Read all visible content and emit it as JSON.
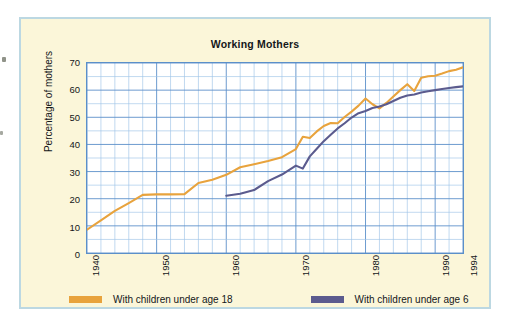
{
  "chart_data": {
    "type": "line",
    "title": "Working Mothers",
    "xlabel": "",
    "ylabel": "Percentage of mothers",
    "xlim": [
      1940,
      1994
    ],
    "ylim": [
      0,
      70
    ],
    "yticks": [
      0,
      10,
      20,
      30,
      40,
      50,
      60,
      70
    ],
    "xticks": [
      1940,
      1950,
      1960,
      1970,
      1980,
      1990,
      1994
    ],
    "grid": true,
    "grid_minor_x_step": 2,
    "grid_y_step": 5,
    "legend_position": "bottom",
    "series": [
      {
        "name": "With children under age 18",
        "color": "#e8a33d",
        "x": [
          1940,
          1942,
          1944,
          1946,
          1948,
          1950,
          1952,
          1954,
          1956,
          1958,
          1960,
          1962,
          1964,
          1966,
          1968,
          1970,
          1971,
          1972,
          1973,
          1974,
          1975,
          1976,
          1977,
          1978,
          1979,
          1980,
          1981,
          1982,
          1983,
          1984,
          1985,
          1986,
          1987,
          1988,
          1989,
          1990,
          1991,
          1992,
          1993,
          1994
        ],
        "values": [
          8.6,
          12.0,
          15.5,
          18.4,
          21.4,
          21.6,
          21.6,
          21.7,
          25.8,
          27.0,
          28.8,
          31.6,
          32.7,
          33.9,
          35.3,
          38.3,
          42.8,
          42.4,
          44.8,
          46.8,
          47.9,
          47.8,
          50.1,
          52.1,
          54.3,
          56.9,
          54.8,
          53.3,
          55.3,
          57.7,
          60.0,
          62.2,
          59.7,
          64.6,
          65.1,
          65.3,
          66.1,
          67.0,
          67.5,
          68.4
        ]
      },
      {
        "name": "With children under age 6",
        "color": "#5b5b8e",
        "x": [
          1960,
          1962,
          1964,
          1966,
          1968,
          1970,
          1971,
          1972,
          1973,
          1974,
          1975,
          1976,
          1977,
          1978,
          1979,
          1980,
          1981,
          1982,
          1983,
          1984,
          1985,
          1986,
          1987,
          1988,
          1989,
          1990,
          1991,
          1992,
          1993,
          1994
        ],
        "values": [
          21.1,
          21.8,
          23.2,
          26.5,
          28.9,
          32.2,
          31.1,
          35.6,
          38.4,
          41.2,
          43.6,
          45.9,
          47.8,
          49.9,
          51.5,
          52.3,
          53.4,
          54.0,
          54.8,
          56.0,
          57.2,
          58.0,
          58.4,
          59.1,
          59.6,
          60.0,
          60.4,
          60.8,
          61.1,
          61.4
        ]
      }
    ]
  },
  "card": {
    "border_color": "#bcd8e2",
    "background_color": "#fbf6d9"
  },
  "plot": {
    "background_color": "#ffffff",
    "axis_color": "#5b8fc9",
    "grid_major_color": "#5b8fc9",
    "grid_minor_color": "#9ec4e8"
  },
  "legend": {
    "items": [
      {
        "label": "With children under age 18",
        "color": "#e8a33d"
      },
      {
        "label": "With children under age 6",
        "color": "#5b5b8e"
      }
    ]
  }
}
